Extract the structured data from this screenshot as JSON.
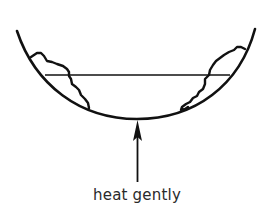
{
  "diagram": {
    "caption": "heat gently",
    "colors": {
      "stroke": "#111111",
      "background": "#ffffff",
      "text": "#2a2a2a"
    },
    "elements": [
      {
        "name": "bowl",
        "type": "curve"
      },
      {
        "name": "liquid-level-line",
        "type": "line"
      },
      {
        "name": "left-deposit",
        "type": "irregular-outline"
      },
      {
        "name": "right-deposit",
        "type": "irregular-outline"
      },
      {
        "name": "heat-arrow",
        "type": "arrow",
        "direction": "up"
      }
    ]
  }
}
